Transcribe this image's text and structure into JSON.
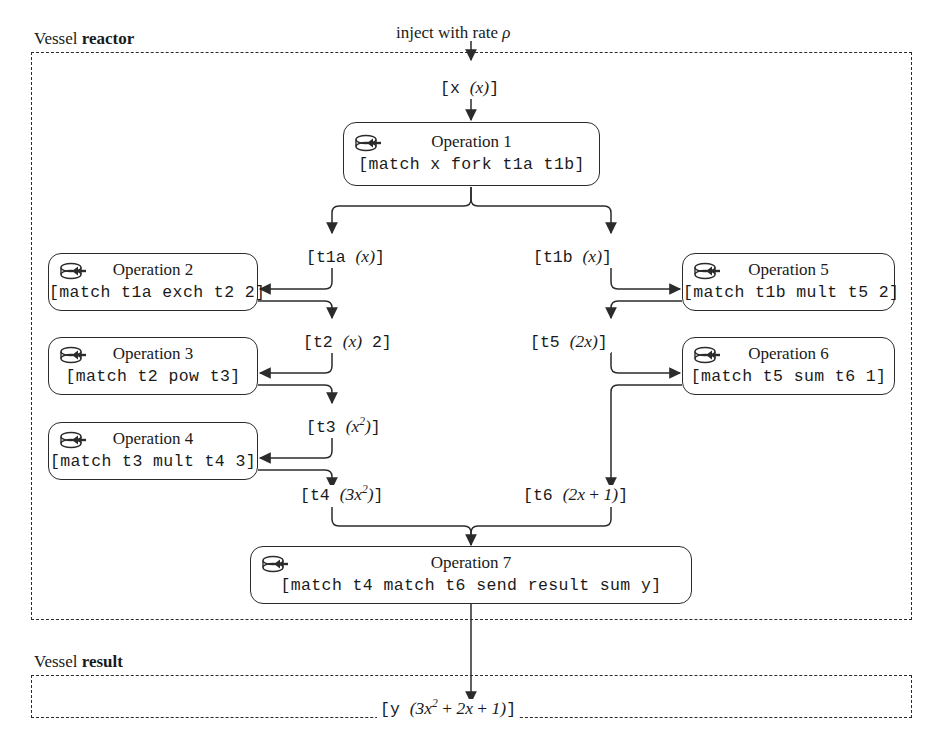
{
  "diagram": {
    "title_annotation": {
      "prefix": "inject with rate ",
      "symbol": "ρ"
    },
    "vessels": [
      {
        "id": "reactor",
        "label_prefix": "Vessel ",
        "label_name": "reactor"
      },
      {
        "id": "result",
        "label_prefix": "Vessel ",
        "label_name": "result"
      }
    ],
    "operations": [
      {
        "id": "op1",
        "title": "Operation 1",
        "code": "[match x fork t1a t1b]",
        "icon": "disk-arrow-icon"
      },
      {
        "id": "op2",
        "title": "Operation 2",
        "code": "[match t1a exch t2 2]",
        "icon": "disk-arrow-icon"
      },
      {
        "id": "op3",
        "title": "Operation 3",
        "code": "[match t2 pow t3]",
        "icon": "disk-arrow-icon"
      },
      {
        "id": "op4",
        "title": "Operation 4",
        "code": "[match t3 mult t4 3]",
        "icon": "disk-arrow-icon"
      },
      {
        "id": "op5",
        "title": "Operation 5",
        "code": "[match t1b mult t5 2]",
        "icon": "disk-arrow-icon"
      },
      {
        "id": "op6",
        "title": "Operation 6",
        "code": "[match t5 sum t6 1]",
        "icon": "disk-arrow-icon"
      },
      {
        "id": "op7",
        "title": "Operation 7",
        "code": "[match t4 match t6 send result sum y]",
        "icon": "disk-arrow-icon"
      }
    ],
    "channels": [
      {
        "id": "x",
        "name": "x",
        "value": "(x)"
      },
      {
        "id": "t1a",
        "name": "t1a",
        "value": "(x)"
      },
      {
        "id": "t1b",
        "name": "t1b",
        "value": "(x)"
      },
      {
        "id": "t2",
        "name": "t2",
        "value": "(x) 2"
      },
      {
        "id": "t3",
        "name": "t3",
        "value": "(x^2)"
      },
      {
        "id": "t4",
        "name": "t4",
        "value": "(3x^2)"
      },
      {
        "id": "t5",
        "name": "t5",
        "value": "(2x)"
      },
      {
        "id": "t6",
        "name": "t6",
        "value": "(2x + 1)"
      },
      {
        "id": "y",
        "name": "y",
        "value": "(3x^2 + 2x + 1)"
      }
    ],
    "colors": {
      "stroke": "#2b2b2b",
      "background": "#ffffff",
      "text": "#1a1a1a"
    }
  }
}
